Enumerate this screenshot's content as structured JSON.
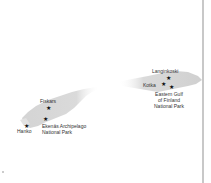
{
  "map": {
    "land_color": "#d6d6d6",
    "marker_color": "#111111",
    "divider_color": "#c8c8c8",
    "places": [
      {
        "id": "langinkoski",
        "name": "Langinkoski",
        "type": "site"
      },
      {
        "id": "kotka",
        "name": "Kotka",
        "type": "town"
      },
      {
        "id": "eastern-gulf",
        "name_lines": [
          "Eastern Gulf",
          "of Finland",
          "National Park"
        ],
        "type": "national-park"
      },
      {
        "id": "fiskars",
        "name": "Fiskars",
        "type": "town"
      },
      {
        "id": "hanko",
        "name": "Hanko",
        "type": "town"
      },
      {
        "id": "ekenas",
        "name_lines": [
          "Ekenäs Archipelago",
          "National Park"
        ],
        "type": "national-park"
      }
    ]
  }
}
